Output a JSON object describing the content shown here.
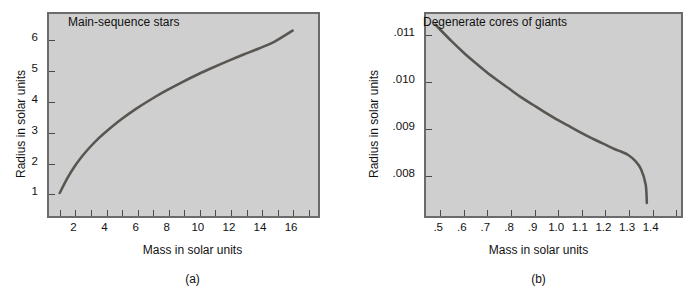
{
  "figure": {
    "background_color": "#ffffff",
    "plot_background_color": "#cfcfcf",
    "plot_border_color": "#6b6b6b",
    "curve_color": "#595550"
  },
  "chart_data": [
    {
      "type": "line",
      "title": "Main-sequence stars",
      "caption": "(a)",
      "xlabel": "Mass in solar units",
      "ylabel": "Radius in solar units",
      "xlim": [
        0.3,
        17.6
      ],
      "ylim": [
        0.3,
        6.85
      ],
      "grid": false,
      "legend": "none",
      "xticks": [
        1,
        2,
        3,
        4,
        5,
        6,
        7,
        8,
        9,
        10,
        11,
        12,
        13,
        14,
        15,
        16,
        17
      ],
      "xticklabels": [
        "",
        "2",
        "",
        "4",
        "",
        "6",
        "",
        "8",
        "",
        "10",
        "",
        "12",
        "",
        "14",
        "",
        "16",
        ""
      ],
      "yticks": [
        1,
        2,
        3,
        4,
        5,
        6
      ],
      "yticklabels": [
        "1",
        "2",
        "3",
        "4",
        "5",
        "6"
      ],
      "x": [
        1.0,
        1.5,
        2.0,
        2.5,
        3.0,
        3.5,
        4.0,
        5.0,
        6.0,
        7.0,
        8.0,
        9.0,
        10.0,
        11.0,
        12.0,
        13.0,
        14.0,
        15.0,
        16.2
      ],
      "y": [
        0.93,
        1.42,
        1.83,
        2.17,
        2.46,
        2.72,
        2.95,
        3.36,
        3.72,
        4.04,
        4.33,
        4.6,
        4.85,
        5.08,
        5.3,
        5.51,
        5.71,
        5.93,
        6.3
      ]
    },
    {
      "type": "line",
      "title": "Degenerate cores of giants",
      "caption": "(b)",
      "xlabel": "Mass in solar units",
      "ylabel": "Radius in solar units",
      "xlim": [
        0.44,
        1.52
      ],
      "ylim": [
        0.00715,
        0.01145
      ],
      "grid": false,
      "legend": "none",
      "xticks": [
        0.5,
        0.6,
        0.7,
        0.8,
        0.9,
        1.0,
        1.1,
        1.2,
        1.3,
        1.4,
        1.5
      ],
      "xticklabels": [
        ".5",
        ".6",
        ".7",
        ".8",
        ".9",
        "1.0",
        "1.1",
        "1.2",
        "1.3",
        "1.4",
        ""
      ],
      "yticks": [
        0.008,
        0.009,
        0.01,
        0.011
      ],
      "yticklabels": [
        ".008",
        ".009",
        ".010",
        ".011"
      ],
      "x": [
        0.48,
        0.55,
        0.6,
        0.65,
        0.7,
        0.75,
        0.8,
        0.85,
        0.9,
        0.95,
        1.0,
        1.05,
        1.1,
        1.15,
        1.2,
        1.25,
        1.28,
        1.31,
        1.34,
        1.365,
        1.385,
        1.39
      ],
      "y": [
        0.01122,
        0.01086,
        0.01062,
        0.0104,
        0.01019,
        0.01,
        0.00982,
        0.00964,
        0.00948,
        0.00932,
        0.00917,
        0.00903,
        0.00889,
        0.00876,
        0.00864,
        0.00852,
        0.00846,
        0.00839,
        0.00826,
        0.00808,
        0.00775,
        0.00735
      ]
    }
  ]
}
